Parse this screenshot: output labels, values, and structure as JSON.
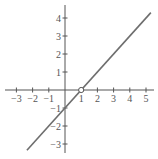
{
  "chart_data": {
    "type": "line",
    "title": "",
    "xlabel": "",
    "ylabel": "",
    "function": "y = x - 1 (with hole at x = 1)",
    "xlim": [
      -3.3,
      5.5
    ],
    "ylim": [
      -3.5,
      4.5
    ],
    "grid": false,
    "x_ticks": [
      -3,
      -2,
      -1,
      1,
      2,
      3,
      4,
      5
    ],
    "x_tick_labels": [
      "−3",
      "−2",
      "−1",
      "1",
      "2",
      "3",
      "4",
      "5"
    ],
    "y_ticks": [
      -3,
      -2,
      -1,
      1,
      2,
      3,
      4
    ],
    "y_tick_labels": [
      "−3",
      "−2",
      "−1",
      "1",
      "2",
      "3",
      "4"
    ],
    "series": [
      {
        "name": "line",
        "x": [
          -2.35,
          5.3
        ],
        "y": [
          -3.35,
          4.3
        ],
        "color": "#6e6e6e"
      }
    ],
    "annotations": [
      {
        "type": "open-circle",
        "x": 1,
        "y": 0,
        "label": "hole"
      }
    ]
  }
}
